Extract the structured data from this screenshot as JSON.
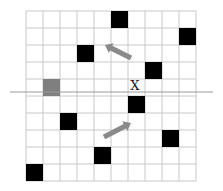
{
  "diagram": {
    "grid": {
      "cols": 10,
      "rows": 10,
      "left": 26,
      "top": 11,
      "cell": 17,
      "line_color": "#c8c8c8"
    },
    "axis_line": {
      "y": 92,
      "x1": 10,
      "x2": 213,
      "color": "#9a9a9a"
    },
    "label_x": {
      "text": "X",
      "x": 135,
      "y": 90
    },
    "black_cells": [
      {
        "col": 5,
        "row": 0
      },
      {
        "col": 9,
        "row": 1
      },
      {
        "col": 3,
        "row": 2
      },
      {
        "col": 7,
        "row": 3
      },
      {
        "col": 6,
        "row": 5
      },
      {
        "col": 2,
        "row": 6
      },
      {
        "col": 8,
        "row": 7
      },
      {
        "col": 4,
        "row": 8
      },
      {
        "col": 0,
        "row": 9
      }
    ],
    "gray_cells": [
      {
        "col": 1,
        "row": 4
      }
    ],
    "colors": {
      "black": "#000000",
      "gray": "#7f7f7f",
      "arrow": "#8a8a8a"
    },
    "arrows": [
      {
        "name": "arrow-up-left",
        "x1": 131,
        "y1": 58,
        "x2": 105,
        "y2": 45
      },
      {
        "name": "arrow-up-right",
        "x1": 104,
        "y1": 137,
        "x2": 131,
        "y2": 123
      }
    ]
  }
}
